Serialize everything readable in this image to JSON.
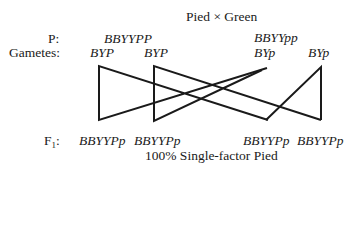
{
  "title": "Pied × Green",
  "rows": {
    "parents_label": "P:",
    "gametes_label": "Gametes:",
    "f1_label_main": "F",
    "f1_label_sub": "1",
    "f1_label_colon": ":"
  },
  "parents": {
    "left": "BBYYPP",
    "right_prefix": "BBYY",
    "right_suffix": "pp"
  },
  "gametes": [
    {
      "prefix": "BYP",
      "suffix": ""
    },
    {
      "prefix": "BYP",
      "suffix": ""
    },
    {
      "prefix": "BY",
      "suffix": "p"
    },
    {
      "prefix": "BY",
      "suffix": "p"
    }
  ],
  "offspring": [
    {
      "prefix": "BBYYP",
      "suffix": "p"
    },
    {
      "prefix": "BBYYP",
      "suffix": "p"
    },
    {
      "prefix": "BBYYP",
      "suffix": "p"
    },
    {
      "prefix": "BBYYP",
      "suffix": "p"
    }
  ],
  "result": "100% Single-factor Pied",
  "colors": {
    "ink": "#1a1a1a",
    "background": "#ffffff"
  }
}
